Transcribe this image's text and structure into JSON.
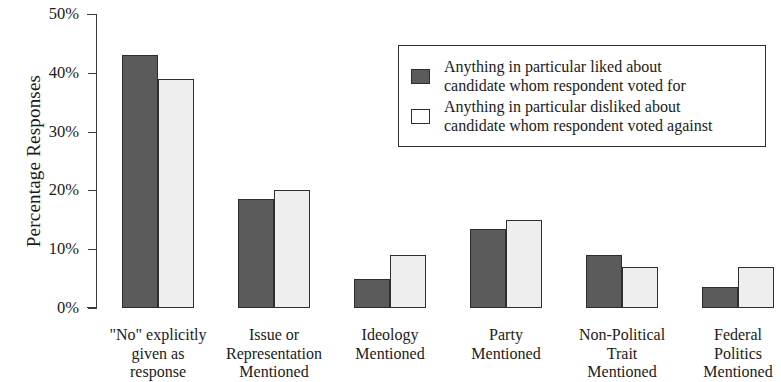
{
  "chart_data": {
    "type": "bar",
    "title": "",
    "xlabel": "",
    "ylabel": "Percentage Responses",
    "ylim": [
      0,
      50
    ],
    "ytick_labels": [
      "0%",
      "10%",
      "20%",
      "30%",
      "40%",
      "50%"
    ],
    "ytick_values": [
      0,
      10,
      20,
      30,
      40,
      50
    ],
    "grid": false,
    "legend_position": "upper-right-inside",
    "categories": [
      "\"No\" explicitly given as response",
      "Issue or Representation Mentioned",
      "Ideology Mentioned",
      "Party Mentioned",
      "Non-Political Trait Mentioned",
      "Federal Politics Mentioned"
    ],
    "category_lines": [
      [
        "\"No\" explicitly",
        "given as",
        "response"
      ],
      [
        "Issue or",
        "Representation",
        "Mentioned"
      ],
      [
        "Ideology",
        "Mentioned"
      ],
      [
        "Party",
        "Mentioned"
      ],
      [
        "Non-Political",
        "Trait",
        "Mentioned"
      ],
      [
        "Federal",
        "Politics",
        "Mentioned"
      ]
    ],
    "series": [
      {
        "name": "Anything in particular liked about candidate whom respondent voted for",
        "color": "#5b5b5b",
        "values": [
          43,
          18.5,
          5,
          13.5,
          9,
          3.5
        ]
      },
      {
        "name": "Anything in particular disliked about candidate whom respondent voted against",
        "color": "#eeeeee",
        "values": [
          39,
          20,
          9,
          15,
          7,
          7
        ]
      }
    ]
  },
  "legend": {
    "items": [
      {
        "line1": "Anything in particular liked about",
        "line2": "candidate whom respondent voted for",
        "swatch": "filled-dark-gray"
      },
      {
        "line1": "Anything in particular disliked about",
        "line2": "candidate whom respondent voted against",
        "swatch": "outlined-white"
      }
    ]
  }
}
